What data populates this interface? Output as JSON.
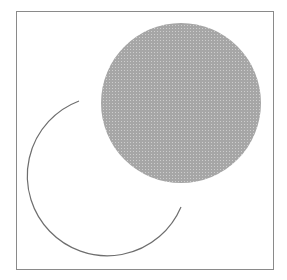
{
  "diagram": {
    "frame": {
      "x": 16,
      "y": 11,
      "width": 257,
      "height": 258,
      "stroke": "#8a8a8a"
    },
    "filled_circle": {
      "cx": 181,
      "cy": 103,
      "r": 80,
      "fill": "#a9a9a9",
      "dot": "#c8c8c8"
    },
    "arc": {
      "start": [
        79,
        101
      ],
      "end": [
        181,
        207
      ],
      "r": 80,
      "stroke": "#6e6e6e",
      "stroke_width": 1.2
    }
  }
}
